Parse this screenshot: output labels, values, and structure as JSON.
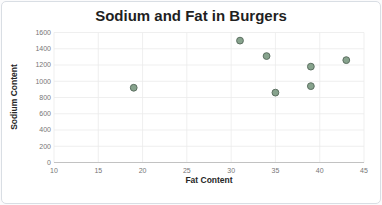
{
  "chart_data": {
    "type": "scatter",
    "title": "Sodium and Fat in Burgers",
    "xlabel": "Fat Content",
    "ylabel": "Sodium Content",
    "xlim": [
      10,
      45
    ],
    "ylim": [
      0,
      1600
    ],
    "x_ticks": [
      10,
      15,
      20,
      25,
      30,
      35,
      40,
      45
    ],
    "y_ticks": [
      0,
      200,
      400,
      600,
      800,
      1000,
      1200,
      1400,
      1600
    ],
    "grid": true,
    "legend": false,
    "points": [
      {
        "x": 19,
        "y": 920
      },
      {
        "x": 31,
        "y": 1500
      },
      {
        "x": 34,
        "y": 1310
      },
      {
        "x": 35,
        "y": 860
      },
      {
        "x": 39,
        "y": 1180
      },
      {
        "x": 39,
        "y": 940
      },
      {
        "x": 43,
        "y": 1260
      }
    ],
    "colors": {
      "point_fill": "#87a38d",
      "point_stroke": "#5c6f61",
      "gridline": "#ebebeb",
      "axis_line": "#c2c2c2",
      "tick_label": "#767676",
      "title": "#1f1f1f",
      "card_border": "#d9dee4",
      "background": "#ffffff"
    }
  }
}
